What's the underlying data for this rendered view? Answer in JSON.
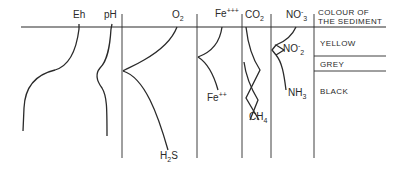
{
  "diagram": {
    "column_headers": {
      "eh": "Eh",
      "ph": "pH",
      "o2": "O",
      "o2_sub": "2",
      "fe3": "Fe",
      "fe3_sup": "+++",
      "co2": "CO",
      "co2_sub": "2",
      "no3": "NO",
      "no3_sup": "-",
      "no3_sub": "3"
    },
    "sediment_header_line1": "COLOUR OF",
    "sediment_header_line2": "THE SEDIMENT",
    "sediment_layers": [
      "YELLOW",
      "GREY",
      "BLACK"
    ],
    "curve_labels": {
      "h2s": "H",
      "h2s_sub": "2",
      "h2s_end": "S",
      "fe2": "Fe",
      "fe2_sup": "++",
      "ch4": "CH",
      "ch4_sub": "4",
      "no2": "NO",
      "no2_sup": "-",
      "no2_sub": "2",
      "nh3": "NH",
      "nh3_sub": "3"
    },
    "line_color": "#2a2a2a"
  }
}
